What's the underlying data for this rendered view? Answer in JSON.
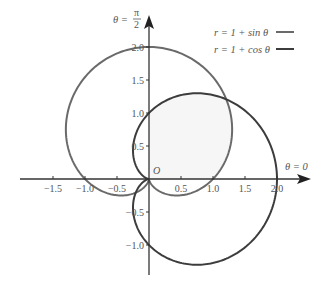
{
  "chart_data": {
    "type": "line",
    "subtype": "polar-curves-on-cartesian-axes",
    "title": "",
    "series": [
      {
        "name": "r = 1 + sin θ",
        "equation": "r = 1 + sin θ",
        "color": "#6a6a6a",
        "theta_range": [
          0,
          6.2832
        ]
      },
      {
        "name": "r = 1 + cos θ",
        "equation": "r = 1 + cos θ",
        "color": "#3c3c3c",
        "theta_range": [
          0,
          6.2832
        ]
      }
    ],
    "x_axis": {
      "label": "θ = 0",
      "ticks": [
        -1.5,
        -1.0,
        -0.5,
        0.5,
        1.0,
        1.5,
        2.0
      ],
      "tick_labels": [
        "−1.5",
        "−1.0",
        "−0.5",
        "0.5",
        "1.0",
        "1.5",
        "2.0"
      ],
      "range": [
        -2.0,
        2.45
      ]
    },
    "y_axis": {
      "label_prefix": "θ =",
      "label_num": "π",
      "label_den": "2",
      "ticks": [
        -1.0,
        -0.5,
        0.5,
        1.0,
        1.5,
        2.0
      ],
      "tick_labels": [
        "−1.0",
        "−0.5",
        "0.5",
        "1.0",
        "1.5",
        "2.0"
      ],
      "range": [
        -1.45,
        2.5
      ]
    },
    "origin_label": "O",
    "shaded_region": "overlap of both cardioids (first quadrant)",
    "shade_color": "#f6f6f6",
    "grid": false,
    "legend_position": "top-right"
  },
  "legend": {
    "items": [
      {
        "label": "r = 1 + sin θ",
        "color": "#6a6a6a"
      },
      {
        "label": "r = 1 + cos θ",
        "color": "#3c3c3c"
      }
    ]
  },
  "layout": {
    "origin_px": [
      149,
      179
    ],
    "scale_x": 64,
    "scale_y": 66
  }
}
